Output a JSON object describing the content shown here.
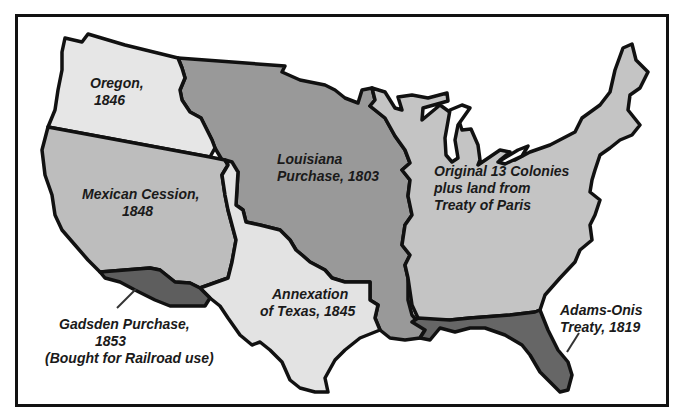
{
  "map": {
    "colors": {
      "border": "#111111",
      "oregon": "#e6e6e6",
      "mexican_cession": "#bdbdbd",
      "louisiana": "#999999",
      "original": "#c4c4c4",
      "texas": "#e3e3e3",
      "gadsden": "#5e5e5e",
      "adams_onis": "#666666",
      "water": "#ffffff"
    },
    "regions": [
      {
        "id": "oregon",
        "label_lines": [
          "Oregon,",
          "1846"
        ]
      },
      {
        "id": "mexican-cession",
        "label_lines": [
          "Mexican Cession,",
          "1848"
        ]
      },
      {
        "id": "louisiana",
        "label_lines": [
          "Louisiana",
          "Purchase, 1803"
        ]
      },
      {
        "id": "original",
        "label_lines": [
          "Original 13 Colonies",
          "plus land from",
          "Treaty of Paris"
        ]
      },
      {
        "id": "texas",
        "label_lines": [
          "Annexation",
          "of Texas, 1845"
        ]
      },
      {
        "id": "gadsden",
        "label_lines": [
          "Gadsden Purchase,",
          "1853",
          "(Bought for Railroad use)"
        ]
      },
      {
        "id": "adams-onis",
        "label_lines": [
          "Adams-Onis",
          "Treaty, 1819"
        ]
      }
    ]
  }
}
